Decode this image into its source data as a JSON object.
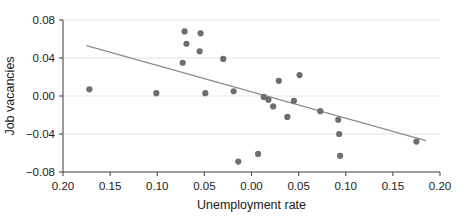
{
  "chart_data": {
    "type": "scatter",
    "title": "",
    "xlabel": "Unemployment rate",
    "ylabel": "Job vacancies",
    "grid": true,
    "legend": null,
    "xlim": [
      -0.2,
      0.2
    ],
    "ylim": [
      -0.08,
      0.08
    ],
    "x_tick_values": [
      -0.2,
      -0.15,
      -0.1,
      -0.05,
      0.0,
      0.05,
      0.1,
      0.15,
      0.2
    ],
    "x_tick_labels": [
      "0.20",
      "0.15",
      "0.10",
      "0.05",
      "0.00",
      "0.05",
      "0.10",
      "0.15",
      "0.20"
    ],
    "y_tick_values": [
      0.08,
      0.04,
      0.0,
      -0.04,
      -0.08
    ],
    "y_tick_labels": [
      "0.08",
      "0.04",
      "0.00",
      "−0.04",
      "−0.08"
    ],
    "marker_color": "#6e6e6e",
    "marker_radius": 3.1,
    "trendline_color": "#8c8c8c",
    "points": [
      {
        "x": -0.172,
        "y": 0.007
      },
      {
        "x": -0.101,
        "y": 0.003
      },
      {
        "x": -0.073,
        "y": 0.035
      },
      {
        "x": -0.071,
        "y": 0.068
      },
      {
        "x": -0.069,
        "y": 0.055
      },
      {
        "x": -0.055,
        "y": 0.047
      },
      {
        "x": -0.054,
        "y": 0.066
      },
      {
        "x": -0.049,
        "y": 0.003
      },
      {
        "x": -0.03,
        "y": 0.039
      },
      {
        "x": -0.019,
        "y": 0.005
      },
      {
        "x": -0.014,
        "y": -0.069
      },
      {
        "x": 0.007,
        "y": -0.061
      },
      {
        "x": 0.013,
        "y": -0.001
      },
      {
        "x": 0.018,
        "y": -0.004
      },
      {
        "x": 0.023,
        "y": -0.011
      },
      {
        "x": 0.029,
        "y": 0.016
      },
      {
        "x": 0.038,
        "y": -0.022
      },
      {
        "x": 0.045,
        "y": -0.005
      },
      {
        "x": 0.051,
        "y": 0.022
      },
      {
        "x": 0.073,
        "y": -0.016
      },
      {
        "x": 0.092,
        "y": -0.025
      },
      {
        "x": 0.093,
        "y": -0.04
      },
      {
        "x": 0.094,
        "y": -0.063
      },
      {
        "x": 0.175,
        "y": -0.048
      }
    ],
    "trendline": {
      "x0": -0.175,
      "y0": 0.053,
      "x1": 0.185,
      "y1": -0.047
    }
  }
}
